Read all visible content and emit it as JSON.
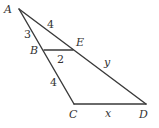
{
  "diagram": {
    "type": "geometry-figure",
    "points": {
      "A": {
        "label": "A",
        "x": 19,
        "y": 9
      },
      "B": {
        "label": "B",
        "x": 44,
        "y": 50
      },
      "C": {
        "label": "C",
        "x": 74,
        "y": 104
      },
      "D": {
        "label": "D",
        "x": 146,
        "y": 104
      },
      "E": {
        "label": "E",
        "x": 73,
        "y": 49
      }
    },
    "segments": [
      {
        "from": "A",
        "to": "C",
        "name": "AC"
      },
      {
        "from": "A",
        "to": "D",
        "name": "AD"
      },
      {
        "from": "B",
        "to": "E",
        "name": "BE"
      },
      {
        "from": "C",
        "to": "D",
        "name": "CD"
      }
    ],
    "measures": {
      "AE": "4",
      "AB": "3",
      "BE": "2",
      "BC": "4",
      "ED": "y",
      "CD": "x"
    }
  }
}
